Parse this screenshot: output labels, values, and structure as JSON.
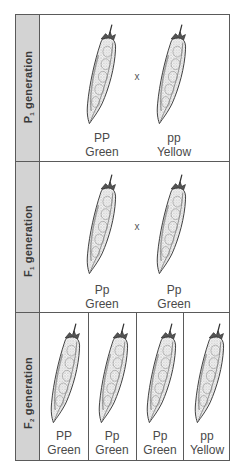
{
  "diagram": {
    "colors": {
      "border": "#5a5a5a",
      "label_column_bg": "#d3d3d3",
      "label_text": "#3a3a3a",
      "caption_text": "#4a4a4a"
    },
    "generations": [
      {
        "id": "p1",
        "label_letter": "P",
        "label_sub": "1",
        "label_word": "generation",
        "cross_symbol": "x",
        "pods": [
          {
            "genotype": "PP",
            "phenotype": "Green",
            "icon": "pea-pod-icon"
          },
          {
            "genotype": "pp",
            "phenotype": "Yellow",
            "icon": "pea-pod-icon"
          }
        ]
      },
      {
        "id": "f1",
        "label_letter": "F",
        "label_sub": "1",
        "label_word": "generation",
        "cross_symbol": "x",
        "pods": [
          {
            "genotype": "Pp",
            "phenotype": "Green",
            "icon": "pea-pod-icon"
          },
          {
            "genotype": "Pp",
            "phenotype": "Green",
            "icon": "pea-pod-icon"
          }
        ]
      },
      {
        "id": "f2",
        "label_letter": "F",
        "label_sub": "2",
        "label_word": "generation",
        "pods": [
          {
            "genotype": "PP",
            "phenotype": "Green",
            "icon": "pea-pod-icon"
          },
          {
            "genotype": "Pp",
            "phenotype": "Green",
            "icon": "pea-pod-icon"
          },
          {
            "genotype": "Pp",
            "phenotype": "Green",
            "icon": "pea-pod-icon"
          },
          {
            "genotype": "pp",
            "phenotype": "Yellow",
            "icon": "pea-pod-icon"
          }
        ]
      }
    ]
  }
}
